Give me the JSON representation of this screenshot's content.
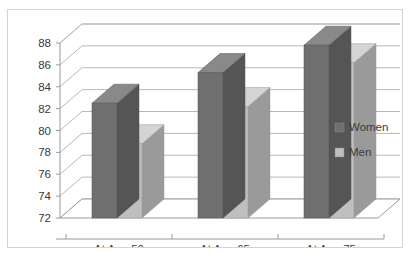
{
  "chart_data": {
    "type": "bar",
    "title": "",
    "subtitle": "",
    "xlabel": "",
    "ylabel": "",
    "categories": [
      "At Age 50",
      "At Age 65",
      "At Age 75"
    ],
    "series": [
      {
        "name": "Women",
        "color": "#706F6F",
        "values": [
          82.5,
          85.3,
          87.8
        ]
      },
      {
        "name": "Men",
        "color": "#BFBFBF",
        "values": [
          78.8,
          82.2,
          86.2
        ]
      }
    ],
    "ylim": [
      72,
      88
    ],
    "ytick_labels": [
      "72",
      "74",
      "76",
      "78",
      "80",
      "82",
      "84",
      "86",
      "88"
    ],
    "ytick_values": [
      72,
      74,
      76,
      78,
      80,
      82,
      84,
      86,
      88
    ],
    "grid": true,
    "legend_position": "right",
    "style": "3d-column",
    "annotations": []
  },
  "legend": {
    "items": [
      {
        "label": "Women",
        "swatch_color": "#706F6F"
      },
      {
        "label": "Men",
        "swatch_color": "#BFBFBF"
      }
    ]
  },
  "colors": {
    "women": "#706F6F",
    "women_side": "#565555",
    "women_top": "#8A8989",
    "men": "#BFBFBF",
    "men_side": "#9A9A9A",
    "men_top": "#D4D4D4",
    "grid": "#b8b8b8",
    "axis": "#9a9a9a",
    "text": "#3a3a3a",
    "border": "#d4d4d4",
    "background": "#ffffff"
  }
}
